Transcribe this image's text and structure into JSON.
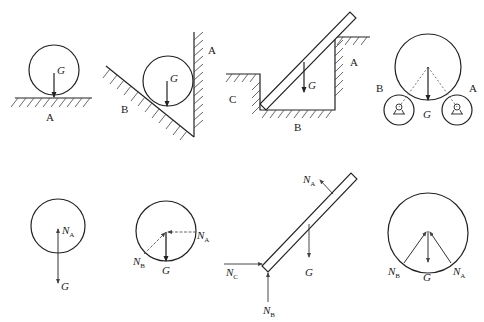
{
  "figure": {
    "colors": {
      "stroke": "#222222",
      "background": "#ffffff"
    }
  },
  "top_row": {
    "fig1": {
      "weight_label": "G",
      "contact_label": "A"
    },
    "fig2": {
      "weight_label": "G",
      "wall_label": "A",
      "incline_label": "B"
    },
    "fig3": {
      "weight_label": "G",
      "label_A": "A",
      "label_B": "B",
      "label_C": "C"
    },
    "fig4": {
      "weight_label": "G",
      "label_A": "A",
      "label_B": "B"
    }
  },
  "bottom_row": {
    "fbd1": {
      "N": "N",
      "N_sub": "A",
      "G": "G"
    },
    "fbd2": {
      "NA": "N",
      "NA_sub": "A",
      "NB": "N",
      "NB_sub": "B",
      "G": "G"
    },
    "fbd3": {
      "NA": "N",
      "NA_sub": "A",
      "NB": "N",
      "NB_sub": "B",
      "NC": "N",
      "NC_sub": "C",
      "G": "G"
    },
    "fbd4": {
      "NA": "N",
      "NA_sub": "A",
      "NB": "N",
      "NB_sub": "B",
      "G": "G"
    }
  }
}
